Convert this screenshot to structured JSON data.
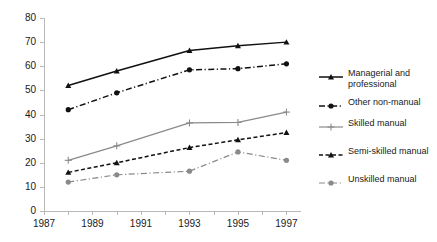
{
  "chart_data": {
    "type": "line",
    "title": "",
    "subtitle": "",
    "xlabel": "",
    "ylabel": "",
    "x": [
      1988,
      1990,
      1993,
      1995,
      1997
    ],
    "xlim": [
      1987,
      1997.6
    ],
    "ylim": [
      0,
      80
    ],
    "xticks": [
      1987,
      1989,
      1991,
      1993,
      1995,
      1997
    ],
    "xticklabels": [
      "1987",
      "1989",
      "1991",
      "1993",
      "1995",
      "1997"
    ],
    "yticks": [
      0,
      10,
      20,
      30,
      40,
      50,
      60,
      70,
      80
    ],
    "yticklabels": [
      "0",
      "10",
      "20",
      "30",
      "40",
      "50",
      "60",
      "70",
      "80"
    ],
    "grid": false,
    "legend_position": "right",
    "series": [
      {
        "name": "Managerial and\nprofessional",
        "legend_label": "Managerial and\nprofessional",
        "values": [
          52,
          58,
          66.5,
          68.5,
          70
        ],
        "color": "#111111",
        "linestyle": "solid",
        "marker": "triangle"
      },
      {
        "name": "Other non-manual",
        "legend_label": "Other non-manual",
        "values": [
          42,
          49,
          58.5,
          59,
          61
        ],
        "color": "#111111",
        "linestyle": "dashdot",
        "marker": "circle"
      },
      {
        "name": "Skilled manual",
        "legend_label": "Skilled manual",
        "values": [
          21,
          27,
          36.5,
          36.7,
          41
        ],
        "color": "#8a8a8a",
        "linestyle": "solid",
        "marker": "plus"
      },
      {
        "name": "Semi-skilled manual",
        "legend_label": "Semi-skilled manual",
        "values": [
          16,
          20,
          26.3,
          29.5,
          32.5
        ],
        "color": "#111111",
        "linestyle": "dashed",
        "marker": "triangle"
      },
      {
        "name": "Unskilled manual",
        "legend_label": "Unskilled manual",
        "values": [
          12,
          15,
          16.5,
          24.5,
          21
        ],
        "color": "#8a8a8a",
        "linestyle": "dashdot",
        "marker": "circle"
      }
    ]
  },
  "legend": {
    "entries": [
      {
        "label": "Managerial and\nprofessional"
      },
      {
        "label": "Other non-manual"
      },
      {
        "label": "Skilled manual"
      },
      {
        "label": "Semi-skilled manual"
      },
      {
        "label": "Unskilled manual"
      }
    ]
  },
  "colors": {
    "axis": "#b9b9b9",
    "text": "#1a1a1a",
    "dark_series": "#111111",
    "gray_series": "#8a8a8a",
    "background": "#ffffff"
  }
}
